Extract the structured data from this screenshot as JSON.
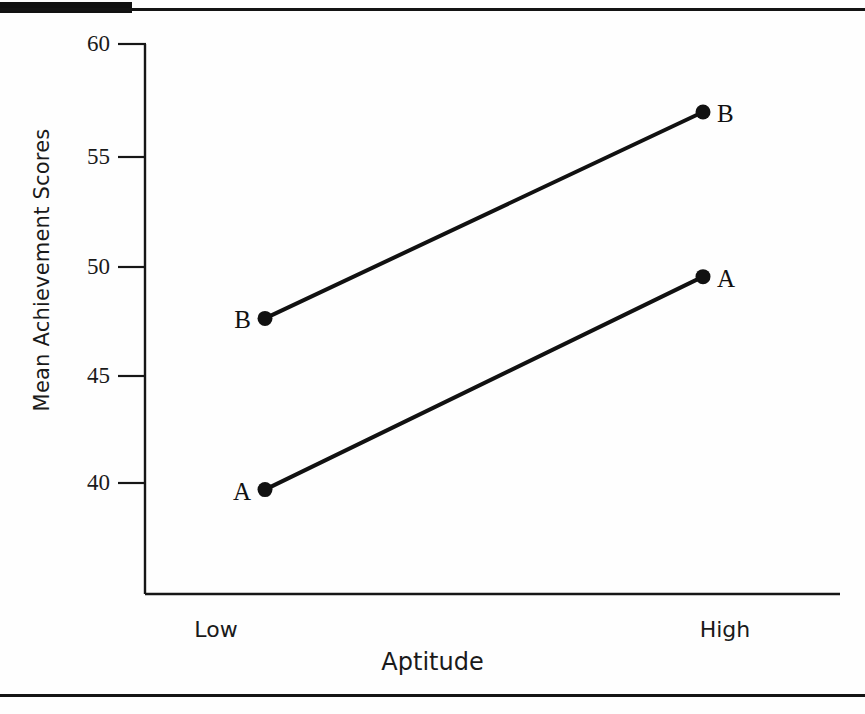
{
  "figure": {
    "kind": "line-plot",
    "background_color": "#fefefe",
    "ink_color": "#111111"
  },
  "axes": {
    "y_title": "Mean Achievement Scores",
    "x_title": "Aptitude",
    "y_ticks": [
      "60",
      "55",
      "50",
      "45",
      "40"
    ],
    "x_ticks": [
      "Low",
      "High"
    ]
  },
  "chart_data": {
    "type": "line",
    "title": "",
    "xlabel": "Aptitude",
    "ylabel": "Mean Achievement Scores",
    "categories": [
      "Low",
      "High"
    ],
    "x": [
      0,
      1
    ],
    "ylim": [
      36,
      60
    ],
    "yticks": [
      40,
      45,
      50,
      55,
      60
    ],
    "grid": false,
    "legend": "none",
    "annotations": [
      {
        "text": "A",
        "series": "A",
        "category": "Low",
        "position": "left"
      },
      {
        "text": "A",
        "series": "A",
        "category": "High",
        "position": "right"
      },
      {
        "text": "B",
        "series": "B",
        "category": "Low",
        "position": "left"
      },
      {
        "text": "B",
        "series": "B",
        "category": "High",
        "position": "right"
      }
    ],
    "series": [
      {
        "name": "A",
        "values": [
          39.7,
          49.4
        ],
        "color": "#111111",
        "marker": "circle",
        "line_width": 3
      },
      {
        "name": "B",
        "values": [
          47.5,
          56.9
        ],
        "color": "#111111",
        "marker": "circle",
        "line_width": 3
      }
    ]
  },
  "geometry": {
    "y_tick_px": {
      "60": 44,
      "55": 157,
      "50": 267,
      "45": 376,
      "40": 483
    },
    "x_pos_px": {
      "Low": 265,
      "High": 703
    },
    "axis_left_px": 145,
    "axis_bottom_px": 594,
    "axis_right_px": 840
  },
  "points": {
    "a_low": {
      "label": "A",
      "x": 270,
      "y": 489,
      "value": 39.7
    },
    "a_high": {
      "label": "A",
      "x": 706,
      "y": 277,
      "value": 49.4
    },
    "b_low": {
      "label": "B",
      "x": 259,
      "y": 318,
      "value": 47.5
    },
    "b_high": {
      "label": "B",
      "x": 701,
      "y": 111,
      "value": 56.9
    }
  }
}
